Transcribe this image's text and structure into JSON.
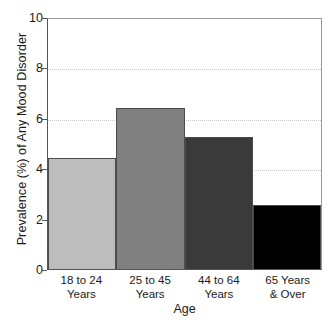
{
  "chart_data": {
    "type": "bar",
    "title": "",
    "xlabel": "Age",
    "ylabel": "Prevalence (%) of Any Mood Disorder",
    "categories": [
      "18 to 24 Years",
      "25 to 45 Years",
      "44 to 64 Years",
      "65 Years & Over"
    ],
    "category_lines": [
      [
        "18 to 24",
        "Years"
      ],
      [
        "25 to 45",
        "Years"
      ],
      [
        "44 to 64",
        "Years"
      ],
      [
        "65 Years",
        "& Over"
      ]
    ],
    "values": [
      4.4,
      6.4,
      5.25,
      2.55
    ],
    "bar_colors": [
      "#bdbdbd",
      "#808080",
      "#3a3a3a",
      "#000000"
    ],
    "ylim": [
      0,
      10
    ],
    "yticks": [
      0,
      2,
      4,
      6,
      8,
      10
    ],
    "ytick_labels": [
      "0",
      "2",
      "4",
      "6",
      "8",
      "10"
    ],
    "gridlines": [
      2,
      4,
      6,
      8
    ],
    "grid": true,
    "legend": false,
    "legend_position": "none",
    "axis_color": "#555555",
    "grid_color": "#c9c9c9",
    "background": "#ffffff"
  }
}
